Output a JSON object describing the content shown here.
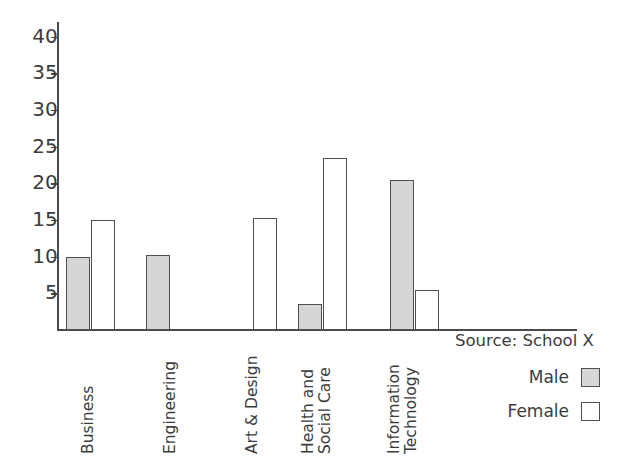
{
  "chart_data": {
    "type": "bar",
    "title": "",
    "subtitle": "",
    "xlabel": "",
    "ylabel": "",
    "categories": [
      "Business",
      "Engineering",
      "Art & Design",
      "Health and Social Care",
      "Information Technology"
    ],
    "category_lines": [
      [
        "Business",
        ""
      ],
      [
        "Engineering",
        ""
      ],
      [
        "Art & Design",
        ""
      ],
      [
        "Health and",
        "Social Care"
      ],
      [
        "Information",
        "Technology"
      ]
    ],
    "series": [
      {
        "name": "Male",
        "color": "#d6d6d6",
        "values": [
          10,
          10.2,
          0,
          3.5,
          20.5
        ]
      },
      {
        "name": "Female",
        "color": "#ffffff",
        "values": [
          15,
          0,
          15.3,
          23.4,
          5.5
        ]
      }
    ],
    "ylim": [
      0,
      42
    ],
    "yticks": [
      5,
      10,
      15,
      20,
      25,
      30,
      35,
      40
    ],
    "ytick_labels": [
      "5",
      "10",
      "15",
      "20",
      "25",
      "30",
      "35",
      "40"
    ],
    "grid": false,
    "legend_position": "bottom-right",
    "annotations": [
      "Source: School X"
    ]
  },
  "source": {
    "text": "Source: School X"
  },
  "legend": {
    "items": [
      {
        "label": "Male",
        "swatch": "gray-filled-square"
      },
      {
        "label": "Female",
        "swatch": "white-outlined-square"
      }
    ]
  },
  "axis": {
    "y_tick_labels": [
      "40",
      "35",
      "30",
      "25",
      "20",
      "15",
      "10",
      "5"
    ]
  }
}
